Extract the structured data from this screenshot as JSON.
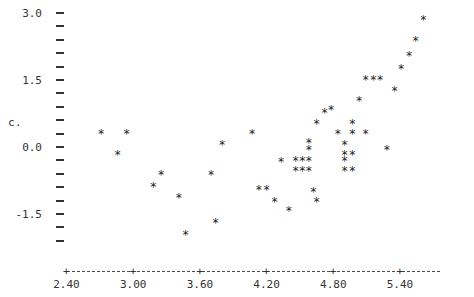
{
  "chart_data": {
    "type": "scatter",
    "title": "",
    "subtitle": "",
    "xlabel": "",
    "ylabel": "c.",
    "marker": "*",
    "grid": false,
    "legend": null,
    "xlim": [
      2.4,
      5.76
    ],
    "ylim": [
      -2.4,
      3.1
    ],
    "xticks": [
      2.4,
      3.0,
      3.6,
      4.2,
      4.8,
      5.4
    ],
    "xtick_labels": [
      "2.40",
      "3.00",
      "3.60",
      "4.20",
      "4.80",
      "5.40"
    ],
    "yticks": [
      3.0,
      2.7,
      2.4,
      2.1,
      1.8,
      1.5,
      1.2,
      0.9,
      0.6,
      0.3,
      0.0,
      -0.3,
      -0.6,
      -0.9,
      -1.2,
      -1.5,
      -1.8,
      -2.1
    ],
    "ytick_labels": [
      "3.0",
      "",
      "",
      "",
      "",
      "1.5",
      "",
      "",
      "",
      "",
      "0.0",
      "",
      "",
      "",
      "",
      "-1.5",
      "",
      ""
    ],
    "x": [
      2.71,
      2.94,
      2.86,
      3.18,
      3.25,
      3.41,
      3.47,
      3.7,
      3.74,
      3.8,
      4.07,
      4.13,
      4.2,
      4.27,
      4.33,
      4.4,
      4.46,
      4.46,
      4.52,
      4.52,
      4.58,
      4.58,
      4.58,
      4.58,
      4.62,
      4.65,
      4.65,
      4.72,
      4.78,
      4.84,
      4.9,
      4.9,
      4.9,
      4.9,
      4.97,
      4.97,
      4.97,
      4.97,
      5.03,
      5.09,
      5.09,
      5.16,
      5.22,
      5.28,
      5.35,
      5.41,
      5.48,
      5.54,
      5.61
    ],
    "y": [
      0.3,
      0.3,
      -0.17,
      -0.88,
      -0.62,
      -1.12,
      -1.95,
      -0.62,
      -1.7,
      0.06,
      0.3,
      -0.94,
      -0.94,
      -1.22,
      -0.33,
      -1.43,
      -0.29,
      -0.52,
      -0.29,
      -0.52,
      0.1,
      -0.05,
      -0.29,
      -0.52,
      -1.0,
      -1.23,
      0.53,
      0.77,
      0.85,
      0.3,
      0.06,
      -0.17,
      -0.29,
      -0.52,
      0.53,
      0.3,
      -0.17,
      -0.52,
      1.05,
      1.52,
      0.3,
      1.52,
      1.52,
      -0.05,
      1.27,
      1.75,
      2.04,
      2.38,
      2.86
    ],
    "n_points": 49
  },
  "axis": {
    "y_caption": "c.",
    "y_tick_glyph": "-",
    "x_tick_glyph": "+",
    "x_axis_glyph": "-"
  },
  "colors": {
    "background": "#ffffff",
    "ink": "#333333",
    "marker": "#1c1c1c"
  }
}
